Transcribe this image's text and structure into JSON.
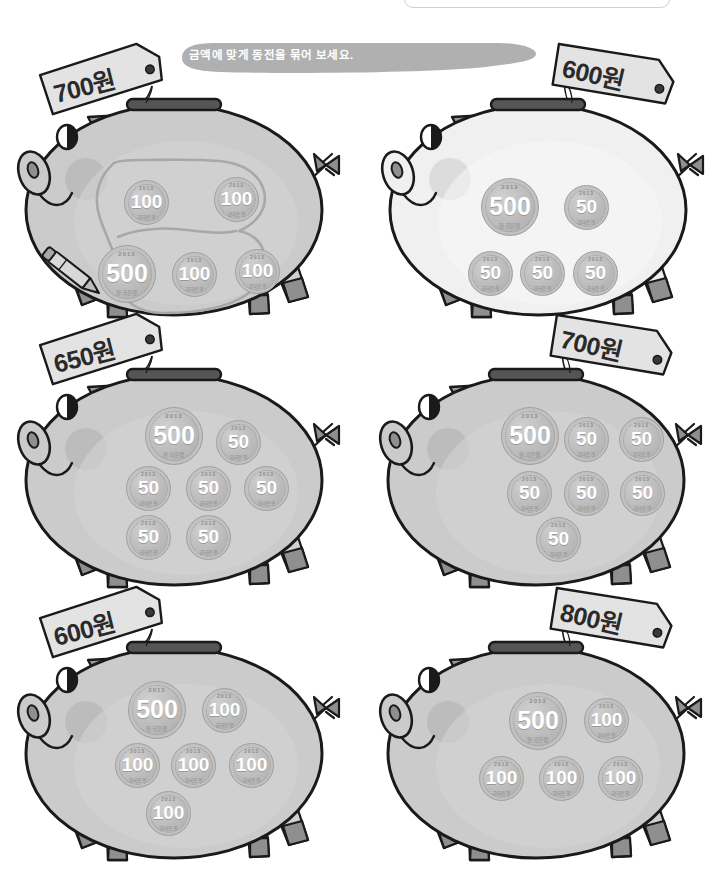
{
  "page": {
    "title": "금액에 맞게 동전을 묶어 보세요.",
    "banner_text": "금액에 맞게 동전을 묶어 보세요.",
    "background_color": "#ffffff",
    "banner_color": "#b0b0b0",
    "coin_year": "2013",
    "coin_bank": "한국은행",
    "currency_unit": "원"
  },
  "pigs": [
    {
      "id": "pig-1",
      "tag_label": "700원",
      "amount": 700,
      "body_tone": "dark",
      "has_lasso": true,
      "has_pencil": true,
      "coins": [
        {
          "value": "100",
          "size": "small",
          "x": 110,
          "y": 125
        },
        {
          "value": "100",
          "size": "small",
          "x": 200,
          "y": 122
        },
        {
          "value": "500",
          "size": "big",
          "x": 84,
          "y": 190
        },
        {
          "value": "100",
          "size": "small",
          "x": 158,
          "y": 197
        },
        {
          "value": "100",
          "size": "small",
          "x": 221,
          "y": 194
        }
      ]
    },
    {
      "id": "pig-2",
      "tag_label": "600원",
      "amount": 600,
      "body_tone": "light",
      "has_lasso": false,
      "has_pencil": false,
      "coins": [
        {
          "value": "500",
          "size": "big",
          "x": 103,
          "y": 123
        },
        {
          "value": "50",
          "size": "small",
          "x": 186,
          "y": 130
        },
        {
          "value": "50",
          "size": "small",
          "x": 90,
          "y": 196
        },
        {
          "value": "50",
          "size": "small",
          "x": 142,
          "y": 196
        },
        {
          "value": "50",
          "size": "small",
          "x": 195,
          "y": 196
        }
      ]
    },
    {
      "id": "pig-3",
      "tag_label": "650원",
      "amount": 650,
      "body_tone": "dark",
      "has_lasso": false,
      "has_pencil": false,
      "coins": [
        {
          "value": "500",
          "size": "big",
          "x": 131,
          "y": 82
        },
        {
          "value": "50",
          "size": "small",
          "x": 202,
          "y": 95
        },
        {
          "value": "50",
          "size": "small",
          "x": 112,
          "y": 141
        },
        {
          "value": "50",
          "size": "small",
          "x": 172,
          "y": 141
        },
        {
          "value": "50",
          "size": "small",
          "x": 230,
          "y": 141
        },
        {
          "value": "50",
          "size": "small",
          "x": 112,
          "y": 190
        },
        {
          "value": "50",
          "size": "small",
          "x": 172,
          "y": 190
        }
      ]
    },
    {
      "id": "pig-4",
      "tag_label": "700원",
      "amount": 700,
      "body_tone": "dark",
      "has_lasso": false,
      "has_pencil": false,
      "coins": [
        {
          "value": "500",
          "size": "big",
          "x": 125,
          "y": 82
        },
        {
          "value": "50",
          "size": "small",
          "x": 188,
          "y": 92
        },
        {
          "value": "50",
          "size": "small",
          "x": 243,
          "y": 92
        },
        {
          "value": "50",
          "size": "small",
          "x": 131,
          "y": 146
        },
        {
          "value": "50",
          "size": "small",
          "x": 188,
          "y": 146
        },
        {
          "value": "50",
          "size": "small",
          "x": 244,
          "y": 146
        },
        {
          "value": "50",
          "size": "small",
          "x": 160,
          "y": 192
        }
      ]
    },
    {
      "id": "pig-5",
      "tag_label": "600원",
      "amount": 600,
      "body_tone": "dark",
      "has_lasso": false,
      "has_pencil": false,
      "coins": [
        {
          "value": "500",
          "size": "big",
          "x": 114,
          "y": 83
        },
        {
          "value": "100",
          "size": "small",
          "x": 188,
          "y": 90
        },
        {
          "value": "100",
          "size": "small",
          "x": 101,
          "y": 145
        },
        {
          "value": "100",
          "size": "small",
          "x": 157,
          "y": 145
        },
        {
          "value": "100",
          "size": "small",
          "x": 215,
          "y": 145
        },
        {
          "value": "100",
          "size": "small",
          "x": 132,
          "y": 193
        }
      ]
    },
    {
      "id": "pig-6",
      "tag_label": "800원",
      "amount": 800,
      "body_tone": "dark",
      "has_lasso": false,
      "has_pencil": false,
      "coins": [
        {
          "value": "500",
          "size": "big",
          "x": 133,
          "y": 94
        },
        {
          "value": "100",
          "size": "small",
          "x": 208,
          "y": 100
        },
        {
          "value": "100",
          "size": "small",
          "x": 103,
          "y": 158
        },
        {
          "value": "100",
          "size": "small",
          "x": 163,
          "y": 158
        },
        {
          "value": "100",
          "size": "small",
          "x": 222,
          "y": 158
        }
      ]
    }
  ],
  "layout": {
    "pig_positions": [
      {
        "left": 14,
        "top": 55
      },
      {
        "left": 378,
        "top": 55
      },
      {
        "left": 14,
        "top": 325
      },
      {
        "left": 376,
        "top": 325
      },
      {
        "left": 14,
        "top": 598
      },
      {
        "left": 376,
        "top": 598
      }
    ],
    "tag_positions": [
      {
        "left": 40,
        "top": 50,
        "rot": -14
      },
      {
        "left": 550,
        "top": 47,
        "rot": 13
      },
      {
        "left": 40,
        "top": 320,
        "rot": -14
      },
      {
        "left": 548,
        "top": 318,
        "rot": 13
      },
      {
        "left": 40,
        "top": 593,
        "rot": -14
      },
      {
        "left": 548,
        "top": 591,
        "rot": 13
      }
    ]
  }
}
